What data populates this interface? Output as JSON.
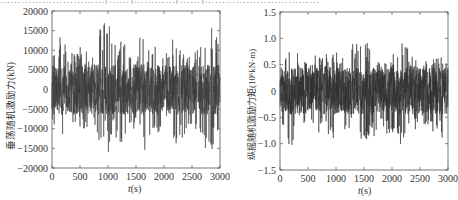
{
  "caption_fragment": "…………………………[……]…………[……]……………………………",
  "chart_data": [
    {
      "type": "line",
      "title": "",
      "xlabel_var": "t",
      "xlabel_unit": "(s)",
      "ylabel": "垂荡随机激励力(kN)",
      "xlim": [
        0,
        3000
      ],
      "ylim": [
        -20000,
        20000
      ],
      "xticks": [
        0,
        500,
        1000,
        1500,
        2000,
        2500,
        3000
      ],
      "xtick_labels": [
        "0",
        "500",
        "1000",
        "1500",
        "2000",
        "2500",
        "3000"
      ],
      "yticks": [
        20000,
        15000,
        10000,
        5000,
        0,
        -5000,
        -10000,
        -15000,
        -20000
      ],
      "ytick_labels": [
        "20000",
        "15000",
        "10000",
        "5000",
        "0",
        "-5000",
        "-10000",
        "-15000",
        "-20000"
      ],
      "grid": false,
      "legend": null,
      "line_color": "#3a3a3a",
      "signal": "random wave excitation, zero-mean",
      "envelope_peaks": {
        "x": [
          0,
          180,
          300,
          480,
          640,
          760,
          880,
          960,
          1000,
          1100,
          1200,
          1350,
          1500,
          1650,
          1700,
          1850,
          2000,
          2100,
          2200,
          2350,
          2500,
          2650,
          2800,
          2900,
          3000
        ],
        "max": [
          9000,
          16000,
          9000,
          12000,
          10000,
          13000,
          16000,
          17500,
          19000,
          13000,
          12500,
          11500,
          10500,
          16500,
          10000,
          11000,
          10000,
          9500,
          16500,
          11000,
          8000,
          12000,
          16500,
          15500,
          12500
        ],
        "min": [
          -8000,
          -16000,
          -9500,
          -11000,
          -11500,
          -10000,
          -17500,
          -12000,
          -18000,
          -11500,
          -16500,
          -12500,
          -11000,
          -16000,
          -11500,
          -12000,
          -10000,
          -9000,
          -15500,
          -12000,
          -9000,
          -12000,
          -17500,
          -14000,
          -11500
        ]
      },
      "rms_approx": 4000
    },
    {
      "type": "line",
      "title": "",
      "xlabel_var": "t",
      "xlabel_unit": "(s)",
      "ylabel": "纵摇随机激励力矩(10⁶kN·m)",
      "xlim": [
        0,
        3000
      ],
      "ylim": [
        -1.5,
        1.5
      ],
      "xticks": [
        0,
        500,
        1000,
        1500,
        2000,
        2500,
        3000
      ],
      "xtick_labels": [
        "0",
        "500",
        "1000",
        "1500",
        "2000",
        "2500",
        "3000"
      ],
      "yticks": [
        1.5,
        1.0,
        0.5,
        0,
        -0.5,
        -1.0,
        -1.5
      ],
      "ytick_labels": [
        "1.5",
        "1.0",
        "0.5",
        "0",
        "-0.5",
        "-1.0",
        "-1.5"
      ],
      "grid": false,
      "legend": null,
      "line_color": "#2e2e2e",
      "signal": "random wave excitation, zero-mean",
      "envelope_peaks": {
        "x": [
          0,
          180,
          350,
          500,
          700,
          900,
          1000,
          1100,
          1300,
          1500,
          1600,
          1800,
          2000,
          2200,
          2300,
          2500,
          2700,
          2900,
          3000
        ],
        "max": [
          0.55,
          1.0,
          0.75,
          0.6,
          0.75,
          0.7,
          0.75,
          0.6,
          0.9,
          1.0,
          0.85,
          0.75,
          0.7,
          1.0,
          0.75,
          0.55,
          0.6,
          0.65,
          0.6
        ],
        "min": [
          -0.6,
          -1.1,
          -0.75,
          -0.7,
          -0.8,
          -0.85,
          -1.1,
          -0.8,
          -0.85,
          -0.95,
          -0.9,
          -0.85,
          -0.8,
          -1.15,
          -0.8,
          -0.7,
          -0.75,
          -0.9,
          -0.65
        ]
      },
      "rms_approx": 0.28
    }
  ]
}
